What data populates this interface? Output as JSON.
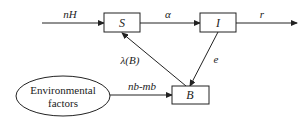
{
  "nodes": {
    "S": "S",
    "I": "I",
    "B": "B",
    "environment_line1": "Environmental",
    "environment_line2": "factors"
  },
  "edges": {
    "input_to_S": "nH",
    "S_to_I": "α",
    "I_out": "r",
    "B_to_S": "λ(B)",
    "I_to_B": "e",
    "env_to_B": "nb-mb"
  }
}
